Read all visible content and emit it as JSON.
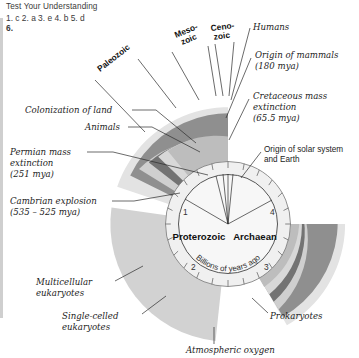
{
  "answer_key": {
    "heading": "Test Your Understanding",
    "row1": "1. c   2. a   3. e   4. b   5. d",
    "row2": "6."
  },
  "figure": {
    "type": "geologic-clock-diagram",
    "center": {
      "x": 228,
      "y": 224
    },
    "eons": [
      {
        "label": "Archaean",
        "x": 251,
        "y": 237
      },
      {
        "label": "Proterozoic",
        "x": 199,
        "y": 237
      }
    ],
    "axis_unit_label": "Billions of years ago",
    "axis_numbers": [
      "1",
      "2",
      "3",
      "4"
    ],
    "axis_number_positions": [
      {
        "label": "1",
        "x": 186,
        "y": 213
      },
      {
        "label": "2",
        "x": 194,
        "y": 267
      },
      {
        "label": "3",
        "x": 262,
        "y": 267
      },
      {
        "label": "4",
        "x": 270,
        "y": 212
      }
    ],
    "eras": [
      {
        "label": "Paleozoic",
        "x": 105,
        "y": 68,
        "rotate": -38
      },
      {
        "label": "Meso-\nzoic",
        "line1": "Meso-",
        "line2": "zoic",
        "x": 183,
        "y": 42,
        "rotate": -24
      },
      {
        "label": "Ceno-\nzoic",
        "line1": "Ceno-",
        "line2": "zoic",
        "x": 217,
        "y": 34,
        "rotate": -8
      }
    ],
    "callouts": [
      {
        "name": "humans",
        "text": "Humans",
        "x": 253,
        "y": 27,
        "style": "hand"
      },
      {
        "name": "origin-of-mammals",
        "line1": "Origin of mammals",
        "line2": "(180 mya)",
        "x": 255,
        "y": 55,
        "style": "hand"
      },
      {
        "name": "cretaceous-mass-extinction",
        "line1": "Cretaceous mass",
        "line2": "extinction",
        "line3": "(65.5 mya)",
        "x": 253,
        "y": 96,
        "style": "hand"
      },
      {
        "name": "origin-of-solar-system-and-earth",
        "line1": "Origin of solar system",
        "line2": "and Earth",
        "x": 264,
        "y": 149,
        "style": "sans"
      },
      {
        "name": "colonization-of-land",
        "text": "Colonization of land",
        "x": 25,
        "y": 110,
        "style": "hand"
      },
      {
        "name": "animals",
        "text": "Animals",
        "x": 85,
        "y": 127,
        "style": "hand"
      },
      {
        "name": "permian-mass-extinction",
        "line1": "Permian mass",
        "line2": "extinction",
        "line3": "(251 mya)",
        "x": 10,
        "y": 152,
        "style": "hand"
      },
      {
        "name": "cambrian-explosion",
        "line1": "Cambrian explosion",
        "line2": "(535 – 525 mya)",
        "x": 10,
        "y": 201,
        "style": "hand"
      },
      {
        "name": "multicellular-eukaryotes",
        "line1": "Multicellular",
        "line2": "eukaryotes",
        "x": 36,
        "y": 282,
        "style": "hand"
      },
      {
        "name": "single-celled-eukaryotes",
        "line1": "Single-celled",
        "line2": "eukaryotes",
        "x": 62,
        "y": 316,
        "style": "hand"
      },
      {
        "name": "prokaryotes",
        "text": "Prokaryotes",
        "x": 270,
        "y": 316,
        "style": "hand"
      },
      {
        "name": "atmospheric-oxygen",
        "text": "Atmospheric oxygen",
        "x": 186,
        "y": 350,
        "style": "hand"
      }
    ],
    "colors": {
      "band_dark": "#6e6e6e",
      "band_mid": "#9a9a9a",
      "band_light": "#c9c9c9",
      "band_pale": "#dedede",
      "band_palest": "#ececec",
      "dial_face": "#f3f3f3",
      "outline": "#555555",
      "text": "#1c1c1c"
    }
  }
}
